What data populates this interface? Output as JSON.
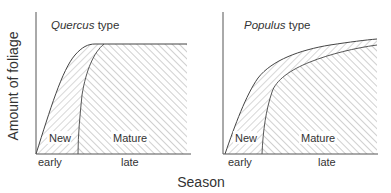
{
  "figure": {
    "y_axis_label": "Amount of foliage",
    "x_axis_label": "Season",
    "colors": {
      "line": "#444444",
      "hatch": "#8a8a8a",
      "background": "#ffffff"
    }
  },
  "panels": [
    {
      "title_italic": "Quercus",
      "title_rest": " type",
      "region_labels": {
        "new": "New",
        "mature": "Mature"
      },
      "tick_labels": {
        "early": "early",
        "late": "late"
      }
    },
    {
      "title_italic": "Populus",
      "title_rest": " type",
      "region_labels": {
        "new": "New",
        "mature": "Mature"
      },
      "tick_labels": {
        "early": "early",
        "late": "late"
      }
    }
  ]
}
